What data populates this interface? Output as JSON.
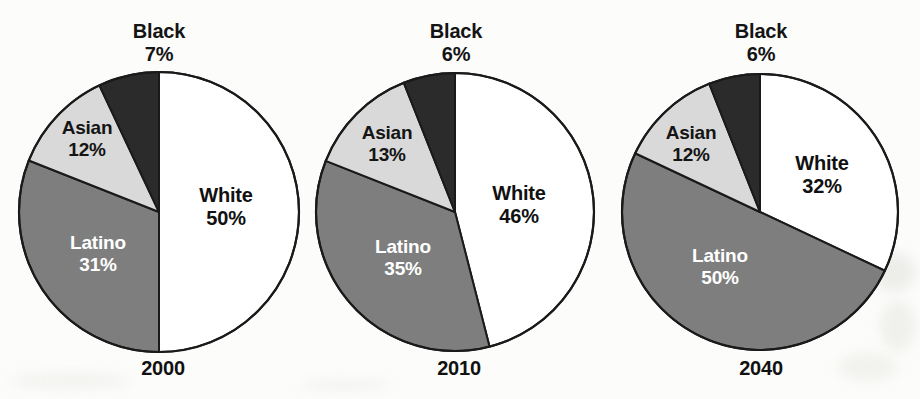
{
  "figure": {
    "background_color": "#fcfcfb",
    "slice_colors": {
      "white": "#ffffff",
      "latino": "#7e7e7e",
      "asian": "#d9d9d9",
      "black": "#2b2b2b"
    },
    "outline_color": "#1a1a1a"
  },
  "chart_data": [
    {
      "type": "pie",
      "title": "2000",
      "labels": [
        "White",
        "Latino",
        "Asian",
        "Black"
      ],
      "values": [
        50,
        31,
        12,
        7
      ],
      "value_labels": [
        "50%",
        "31%",
        "12%",
        "7%"
      ],
      "colors": [
        "#ffffff",
        "#7e7e7e",
        "#d9d9d9",
        "#2b2b2b"
      ],
      "start_angle_deg": 0,
      "direction": "clockwise",
      "legend": "none",
      "labels_position": "on-slice-and-callout",
      "center": [
        159,
        212
      ],
      "radius": 140
    },
    {
      "type": "pie",
      "title": "2010",
      "labels": [
        "White",
        "Latino",
        "Asian",
        "Black"
      ],
      "values": [
        46,
        35,
        13,
        6
      ],
      "value_labels": [
        "46%",
        "35%",
        "13%",
        "6%"
      ],
      "colors": [
        "#ffffff",
        "#7e7e7e",
        "#d9d9d9",
        "#2b2b2b"
      ],
      "start_angle_deg": 0,
      "direction": "clockwise",
      "legend": "none",
      "labels_position": "on-slice-and-callout",
      "center": [
        455,
        212
      ],
      "radius": 139
    },
    {
      "type": "pie",
      "title": "2040",
      "labels": [
        "White",
        "Latino",
        "Asian",
        "Black"
      ],
      "values": [
        32,
        50,
        12,
        6
      ],
      "value_labels": [
        "32%",
        "50%",
        "12%",
        "6%"
      ],
      "colors": [
        "#ffffff",
        "#7e7e7e",
        "#d9d9d9",
        "#2b2b2b"
      ],
      "start_angle_deg": 0,
      "direction": "clockwise",
      "legend": "none",
      "labels_position": "on-slice-and-callout",
      "center": [
        760,
        212
      ],
      "radius": 138
    }
  ],
  "charts": [
    {
      "year": "2000",
      "black": {
        "name": "Black",
        "pct": "7%"
      },
      "asian": {
        "name": "Asian",
        "pct": "12%"
      },
      "white": {
        "name": "White",
        "pct": "50%"
      },
      "latino": {
        "name": "Latino",
        "pct": "31%"
      }
    },
    {
      "year": "2010",
      "black": {
        "name": "Black",
        "pct": "6%"
      },
      "asian": {
        "name": "Asian",
        "pct": "13%"
      },
      "white": {
        "name": "White",
        "pct": "46%"
      },
      "latino": {
        "name": "Latino",
        "pct": "35%"
      }
    },
    {
      "year": "2040",
      "black": {
        "name": "Black",
        "pct": "6%"
      },
      "asian": {
        "name": "Asian",
        "pct": "12%"
      },
      "white": {
        "name": "White",
        "pct": "32%"
      },
      "latino": {
        "name": "Latino",
        "pct": "50%"
      }
    }
  ]
}
